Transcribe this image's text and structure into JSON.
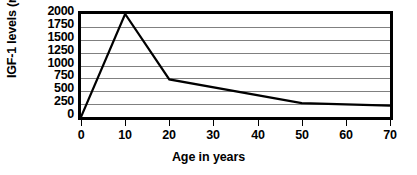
{
  "chart_data": {
    "type": "line",
    "title": "",
    "xlabel": "Age in years",
    "ylabel": "IGF-1 levels (mcg)",
    "x": [
      0,
      10,
      20,
      50,
      70
    ],
    "values": [
      0,
      2000,
      730,
      270,
      220
    ],
    "series": [
      {
        "name": "IGF-1 level",
        "x": [
          0,
          10,
          20,
          50,
          70
        ],
        "values": [
          0,
          2000,
          730,
          270,
          220
        ],
        "color": "#000000"
      }
    ],
    "xlim": [
      0,
      70
    ],
    "ylim": [
      0,
      2000
    ],
    "xticks": [
      0,
      10,
      20,
      30,
      40,
      50,
      60,
      70
    ],
    "xtick_labels": [
      "0",
      "10",
      "20",
      "30",
      "40",
      "50",
      "60",
      "70"
    ],
    "yticks": [
      0,
      250,
      500,
      750,
      1000,
      1250,
      1500,
      1750,
      2000
    ],
    "ytick_labels": [
      "0",
      "250",
      "500",
      "750",
      "1000",
      "1250",
      "1500",
      "1750",
      "2000"
    ],
    "grid": "horizontal",
    "grid_color": "#808080",
    "frame_color": "#000000",
    "background": "#ffffff",
    "legend": "none"
  }
}
